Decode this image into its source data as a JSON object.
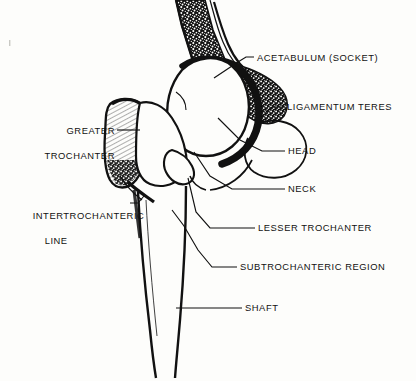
{
  "figure": {
    "background_color": "#fdfdfb",
    "ink_color": "#111111",
    "width": 416,
    "height": 381
  },
  "labels": [
    {
      "id": "acetabulum",
      "text": "ACETABULUM (SOCKET)",
      "lines": [
        "ACETABULUM (SOCKET)"
      ],
      "align": "left",
      "x": 257,
      "y": 52,
      "leader_from": [
        254,
        57
      ],
      "leader_to": [
        211,
        78
      ]
    },
    {
      "id": "ligamentum-teres",
      "text": "LIGAMENTUM TERES",
      "lines": [
        "LIGAMENTUM TERES"
      ],
      "align": "left",
      "x": 287,
      "y": 101,
      "leader_from": [
        284,
        107
      ],
      "leader_to": [
        266,
        113
      ]
    },
    {
      "id": "head",
      "text": "HEAD",
      "lines": [
        "HEAD"
      ],
      "align": "left",
      "x": 288,
      "y": 145,
      "leader_from": [
        285,
        151
      ],
      "leader_to": [
        216,
        117
      ]
    },
    {
      "id": "neck",
      "text": "NECK",
      "lines": [
        "NECK"
      ],
      "align": "left",
      "x": 288,
      "y": 183,
      "leader_from": [
        285,
        189
      ],
      "leader_to": [
        193,
        150
      ]
    },
    {
      "id": "lesser-trochanter",
      "text": "LESSER TROCHANTER",
      "lines": [
        "LESSER TROCHANTER"
      ],
      "align": "left",
      "x": 258,
      "y": 222,
      "leader_from": [
        255,
        228
      ],
      "leader_to": [
        186,
        163
      ]
    },
    {
      "id": "subtrochanteric-region",
      "text": "SUBTROCHANTERIC REGION",
      "lines": [
        "SUBTROCHANTERIC REGION"
      ],
      "align": "left",
      "x": 240,
      "y": 261,
      "leader_from": [
        237,
        267
      ],
      "leader_to": [
        167,
        215
      ]
    },
    {
      "id": "shaft",
      "text": "SHAFT",
      "lines": [
        "SHAFT"
      ],
      "align": "left",
      "x": 245,
      "y": 302,
      "leader_from": [
        242,
        308
      ],
      "leader_to": [
        176,
        308
      ]
    },
    {
      "id": "greater-trochanter",
      "text": "GREATER TROCHANTER",
      "lines": [
        "GREATER",
        "TROCHANTER"
      ],
      "align": "right",
      "x": 22,
      "y": 112,
      "leader_from": [
        117,
        130
      ],
      "leader_to": [
        139,
        130
      ]
    },
    {
      "id": "intertrochanteric-line",
      "text": "INTERTROCHANTERIC LINE",
      "lines": [
        "INTERTROCHANTERIC",
        "LINE"
      ],
      "align": "left",
      "x": 20,
      "y": 197,
      "leader_from": [
        130,
        203
      ],
      "leader_to": [
        143,
        197
      ]
    }
  ]
}
